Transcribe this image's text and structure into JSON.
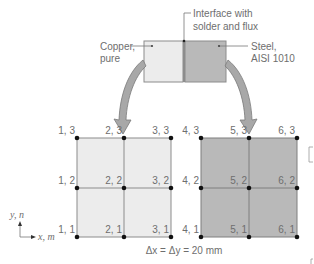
{
  "colors": {
    "copper_fill": "#ececec",
    "steel_fill": "#b9b9b9",
    "border": "#8c8c8c",
    "node": "#111111",
    "arrow_fill": "#a8a8a8",
    "text": "#6e6e6e"
  },
  "callouts": {
    "interface_line1": "Interface with",
    "interface_line2": "solder and flux",
    "copper_line1": "Copper,",
    "copper_line2": "pure",
    "steel_line1": "Steel,",
    "steel_line2": "AISI 1010"
  },
  "axes": {
    "y_label": "y, n",
    "x_label": "x, m"
  },
  "caption": "Δx = Δy = 20 mm",
  "copper_nodes": [
    {
      "label": "1, 3",
      "m": 1,
      "n": 3
    },
    {
      "label": "2, 3",
      "m": 2,
      "n": 3
    },
    {
      "label": "3, 3",
      "m": 3,
      "n": 3
    },
    {
      "label": "1, 2",
      "m": 1,
      "n": 2
    },
    {
      "label": "2, 2",
      "m": 2,
      "n": 2
    },
    {
      "label": "3, 2",
      "m": 3,
      "n": 2
    },
    {
      "label": "1, 1",
      "m": 1,
      "n": 1
    },
    {
      "label": "2, 1",
      "m": 2,
      "n": 1
    },
    {
      "label": "3, 1",
      "m": 3,
      "n": 1
    }
  ],
  "steel_nodes": [
    {
      "label": "4, 3",
      "m": 4,
      "n": 3
    },
    {
      "label": "5, 3",
      "m": 5,
      "n": 3
    },
    {
      "label": "6, 3",
      "m": 6,
      "n": 3
    },
    {
      "label": "4, 2",
      "m": 4,
      "n": 2
    },
    {
      "label": "5, 2",
      "m": 5,
      "n": 2
    },
    {
      "label": "6, 2",
      "m": 6,
      "n": 2
    },
    {
      "label": "4, 1",
      "m": 4,
      "n": 1
    },
    {
      "label": "5, 1",
      "m": 5,
      "n": 1
    },
    {
      "label": "6, 1",
      "m": 6,
      "n": 1
    }
  ]
}
